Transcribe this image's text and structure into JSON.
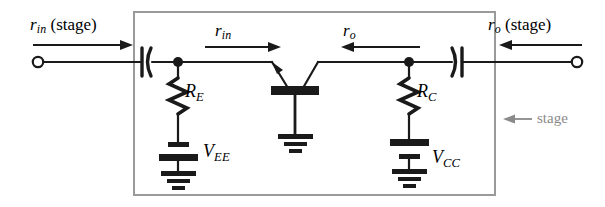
{
  "figure": {
    "type": "circuit-diagram",
    "background_color": "#ffffff",
    "wire_color": "#1a1a1a",
    "box_color": "#9a9a9a",
    "annotation_color": "#8a8a8a"
  },
  "labels": {
    "r_in_stage": {
      "symbol": "r",
      "subscript": "in",
      "qualifier": "(stage)",
      "full": "r_in (stage)"
    },
    "r_o_stage": {
      "symbol": "r",
      "subscript": "o",
      "qualifier": "(stage)",
      "full": "r_o (stage)"
    },
    "r_in": {
      "symbol": "r",
      "subscript": "in",
      "full": "r_in"
    },
    "r_o": {
      "symbol": "r",
      "subscript": "o",
      "full": "r_o"
    },
    "r_e": {
      "symbol": "R",
      "subscript": "E",
      "full": "R_E"
    },
    "r_c": {
      "symbol": "R",
      "subscript": "C",
      "full": "R_C"
    },
    "v_ee": {
      "symbol": "V",
      "subscript": "EE",
      "full": "V_EE"
    },
    "v_cc": {
      "symbol": "V",
      "subscript": "CC",
      "full": "V_CC"
    },
    "stage_box": {
      "text": "stage"
    }
  },
  "components": {
    "input_terminal": {
      "name": "input-terminal",
      "shape": "open-circle"
    },
    "output_terminal": {
      "name": "output-terminal",
      "shape": "open-circle"
    },
    "input_coupling_capacitor": {
      "name": "C1",
      "orientation": "plate-then-curve"
    },
    "output_coupling_capacitor": {
      "name": "C2",
      "orientation": "curve-then-plate"
    },
    "emitter_resistor": {
      "name": "R_E",
      "type": "zigzag-resistor"
    },
    "collector_resistor": {
      "name": "R_C",
      "type": "zigzag-resistor"
    },
    "emitter_supply": {
      "name": "V_EE",
      "type": "battery"
    },
    "collector_supply": {
      "name": "V_CC",
      "type": "battery"
    },
    "transistor": {
      "name": "Q1",
      "type": "bjt",
      "configuration": "common-base"
    },
    "grounds": [
      "emitter-branch-ground",
      "base-ground",
      "collector-branch-ground"
    ]
  },
  "arrows": {
    "r_in_stage_direction": "right",
    "r_in_direction": "right",
    "r_o_direction": "left",
    "r_o_stage_direction": "left",
    "stage_pointer_direction": "left"
  }
}
